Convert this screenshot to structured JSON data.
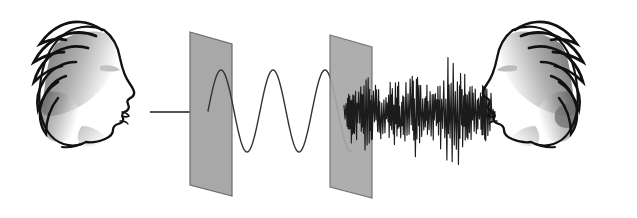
{
  "canvas": {
    "width": 637,
    "height": 218,
    "background": "#ffffff",
    "title": "Speech signal transmission through noisy channel"
  },
  "palette": {
    "ink": "#1a1a1a",
    "outline": "#111111",
    "plane_fill": "#a8a8a8",
    "plane_edge": "#6b6b6b",
    "hair_shadow_dark": "#4a4a4a",
    "hair_shadow_mid": "#8e8e8e",
    "hair_shadow_light": "#c9c9c9",
    "wave_stroke": "#333333",
    "noise_stroke": "#1c1c1c",
    "arrow_stroke": "#1a1a1a",
    "background": "#ffffff"
  },
  "elements": {
    "speaker_head": {
      "name": "speaker-head",
      "label": "Speaker head profile facing right",
      "facing": "right",
      "x": 28,
      "y": 14,
      "width": 120,
      "height": 138
    },
    "listener_head": {
      "name": "listener-head",
      "label": "Listener head profile facing left",
      "facing": "left",
      "x": 497,
      "y": 14,
      "width": 120,
      "height": 138
    },
    "input_arrow": {
      "name": "input-arrow",
      "label": "Arrow indicating signal entering channel",
      "x1": 150,
      "y1": 112,
      "x2": 222,
      "y2": 112,
      "stroke_width": 1.6,
      "head_length": 13,
      "head_width": 9
    },
    "plane_near": {
      "name": "channel-plane-input",
      "label": "Input boundary plane",
      "points": "190,32 232,44 232,196 190,185"
    },
    "plane_far": {
      "name": "channel-plane-output",
      "label": "Output boundary plane",
      "points": "330,35 372,47 372,198 330,187"
    },
    "clean_wave": {
      "name": "clean-sine-wave",
      "label": "Clean periodic speech signal",
      "x_start": 208,
      "x_end": 352,
      "baseline": 111,
      "amplitude": 41,
      "period": 52,
      "phase": 0.0,
      "stroke_width": 1.4
    },
    "noise_wave": {
      "name": "noisy-waveform",
      "label": "Degraded noisy speech signal",
      "x_start": 344,
      "x_end": 494,
      "baseline": 112,
      "stroke_width": 1.15,
      "spike_spacing": 1.05,
      "envelope_points": [
        {
          "x": 344,
          "a": 10
        },
        {
          "x": 352,
          "a": 34
        },
        {
          "x": 360,
          "a": 26
        },
        {
          "x": 368,
          "a": 44
        },
        {
          "x": 376,
          "a": 30
        },
        {
          "x": 386,
          "a": 22
        },
        {
          "x": 396,
          "a": 38
        },
        {
          "x": 404,
          "a": 30
        },
        {
          "x": 414,
          "a": 46
        },
        {
          "x": 424,
          "a": 34
        },
        {
          "x": 432,
          "a": 26
        },
        {
          "x": 442,
          "a": 40
        },
        {
          "x": 452,
          "a": 52
        },
        {
          "x": 460,
          "a": 44
        },
        {
          "x": 468,
          "a": 30
        },
        {
          "x": 476,
          "a": 24
        },
        {
          "x": 484,
          "a": 34
        },
        {
          "x": 490,
          "a": 22
        },
        {
          "x": 494,
          "a": 12
        }
      ]
    }
  }
}
